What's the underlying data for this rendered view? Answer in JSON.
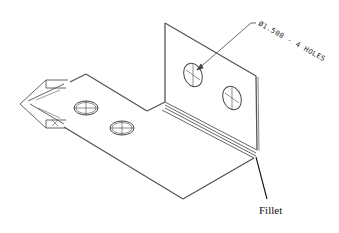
{
  "drawing": {
    "type": "isometric sheet-metal bracket",
    "hole_note": "Ø1.500 - 4 HOLES",
    "callout_label": "Fillet",
    "colors": {
      "line": "#555555",
      "thin_line": "#777777",
      "background": "#ffffff",
      "label": "#111111"
    }
  }
}
